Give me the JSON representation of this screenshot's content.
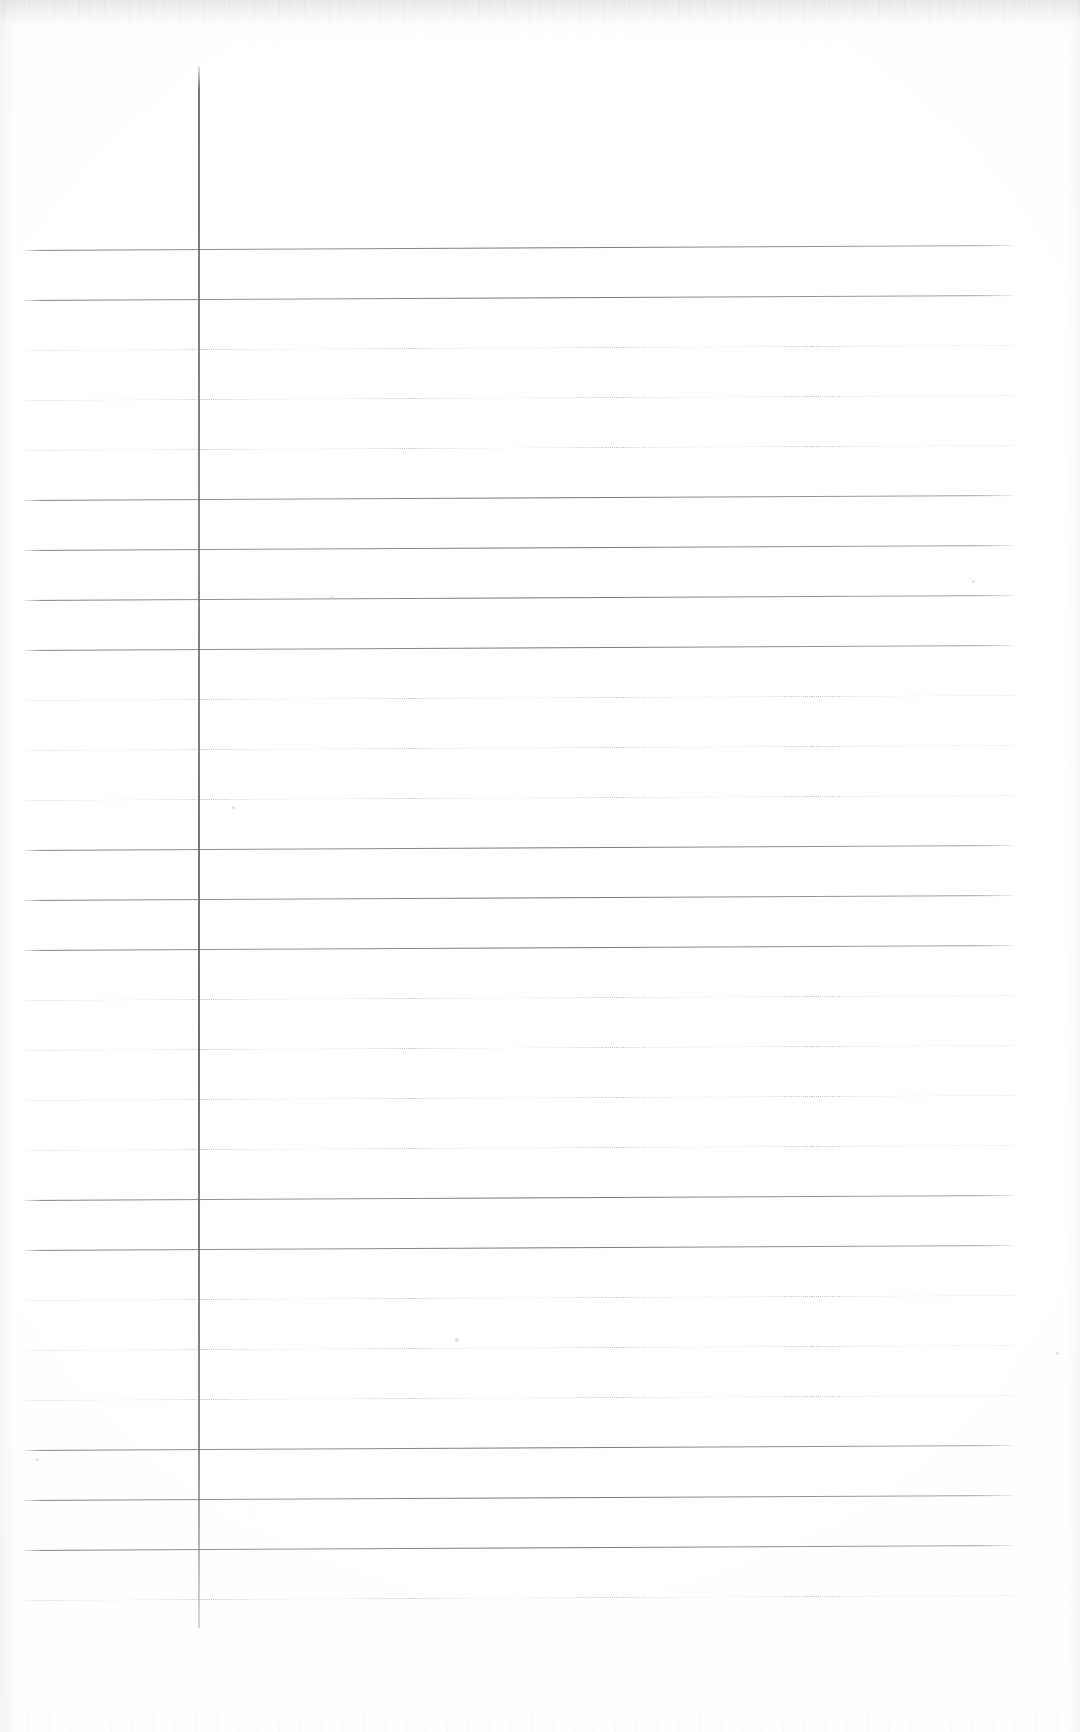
{
  "document": {
    "kind": "scanned-lined-paper",
    "title": "Blank ruled notebook page (scan)",
    "page_width": 1080,
    "page_height": 1732,
    "background_color": "#ffffff",
    "has_handwriting": false,
    "has_text": false,
    "visible_text": ""
  },
  "margin_rule": {
    "name": "vertical-margin-line",
    "orientation": "vertical",
    "x": 198,
    "y_start": 66,
    "y_end": 1628,
    "width_px": 2,
    "color": "#6e7075"
  },
  "ruling": {
    "line_color": "#74767b",
    "left_x": 24,
    "right_x": 1014,
    "spacing_px": 50,
    "first_y": 250,
    "count": 28,
    "skew_px": -5,
    "lines": [
      {
        "y": 250,
        "style": "solid",
        "weight": "dark"
      },
      {
        "y": 300,
        "style": "solid",
        "weight": "dark"
      },
      {
        "y": 350,
        "style": "dotted",
        "weight": "faint"
      },
      {
        "y": 400,
        "style": "dotted",
        "weight": "faint"
      },
      {
        "y": 450,
        "style": "dotted",
        "weight": "faint"
      },
      {
        "y": 500,
        "style": "solid",
        "weight": "dark"
      },
      {
        "y": 550,
        "style": "solid",
        "weight": "dark"
      },
      {
        "y": 600,
        "style": "solid",
        "weight": "dark"
      },
      {
        "y": 650,
        "style": "solid",
        "weight": "dark"
      },
      {
        "y": 700,
        "style": "dotted",
        "weight": "faint"
      },
      {
        "y": 750,
        "style": "dotted",
        "weight": "faint"
      },
      {
        "y": 800,
        "style": "dotted",
        "weight": "faint"
      },
      {
        "y": 850,
        "style": "solid",
        "weight": "dark"
      },
      {
        "y": 900,
        "style": "solid",
        "weight": "dark"
      },
      {
        "y": 950,
        "style": "solid",
        "weight": "dark"
      },
      {
        "y": 1000,
        "style": "dotted",
        "weight": "faint"
      },
      {
        "y": 1050,
        "style": "dotted",
        "weight": "faint"
      },
      {
        "y": 1100,
        "style": "dotted",
        "weight": "faint"
      },
      {
        "y": 1150,
        "style": "dotted",
        "weight": "faint"
      },
      {
        "y": 1200,
        "style": "solid",
        "weight": "dark"
      },
      {
        "y": 1250,
        "style": "solid",
        "weight": "dark"
      },
      {
        "y": 1300,
        "style": "dotted",
        "weight": "faint"
      },
      {
        "y": 1350,
        "style": "dotted",
        "weight": "faint"
      },
      {
        "y": 1400,
        "style": "dotted",
        "weight": "faint"
      },
      {
        "y": 1450,
        "style": "solid",
        "weight": "dark"
      },
      {
        "y": 1500,
        "style": "solid",
        "weight": "dark"
      },
      {
        "y": 1550,
        "style": "solid",
        "weight": "dark"
      },
      {
        "y": 1600,
        "style": "dotted",
        "weight": "faint"
      }
    ]
  },
  "scan_artifacts": {
    "top_smudge": true,
    "bottom_noise": true,
    "left_edge_shadow": true,
    "right_edge_shadow": true,
    "specks": [
      {
        "x": 330,
        "y": 596,
        "size": 3
      },
      {
        "x": 232,
        "y": 806,
        "size": 3
      },
      {
        "x": 455,
        "y": 1338,
        "size": 4
      },
      {
        "x": 972,
        "y": 580,
        "size": 3
      },
      {
        "x": 36,
        "y": 1458,
        "size": 3
      },
      {
        "x": 1056,
        "y": 1352,
        "size": 3
      }
    ]
  }
}
